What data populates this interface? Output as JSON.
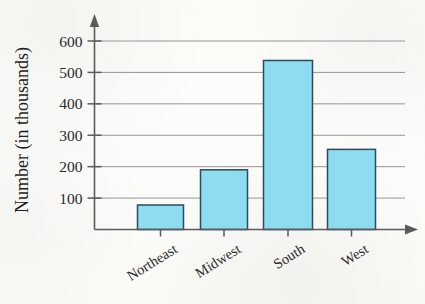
{
  "chart_data": {
    "type": "bar",
    "title": "",
    "subtitle": "",
    "xlabel": "",
    "ylabel": "Number (in thousands)",
    "categories": [
      "Northeast",
      "Midwest",
      "South",
      "West"
    ],
    "values": [
      78,
      190,
      538,
      255
    ],
    "series": [
      {
        "name": "Number (in thousands)",
        "values": [
          78,
          190,
          538,
          255
        ]
      }
    ],
    "ylim": [
      0,
      640
    ],
    "yticks": [
      100,
      200,
      300,
      400,
      500,
      600
    ],
    "ytick_labels": [
      "100",
      "200",
      "300",
      "400",
      "500",
      "600"
    ],
    "xtick_labels": [
      "Northeast",
      "Midwest",
      "South",
      "West"
    ],
    "xtick_rotation_deg": 32,
    "grid": true,
    "grid_axis": "y",
    "legend": false,
    "legend_position": "none",
    "annotations": [],
    "colors": {
      "bar_fill": "#8DDCF0",
      "bar_stroke": "#2F4A5C",
      "gridline": "#8A8A8E",
      "axis": "#5A5A5F",
      "text": "#2A2A2D",
      "background": "#FDFDFB"
    }
  },
  "axes": {
    "y_axis_name": "y-axis",
    "x_axis_name": "x-axis",
    "y_arrow": "arrow-up",
    "x_arrow": "arrow-right"
  }
}
